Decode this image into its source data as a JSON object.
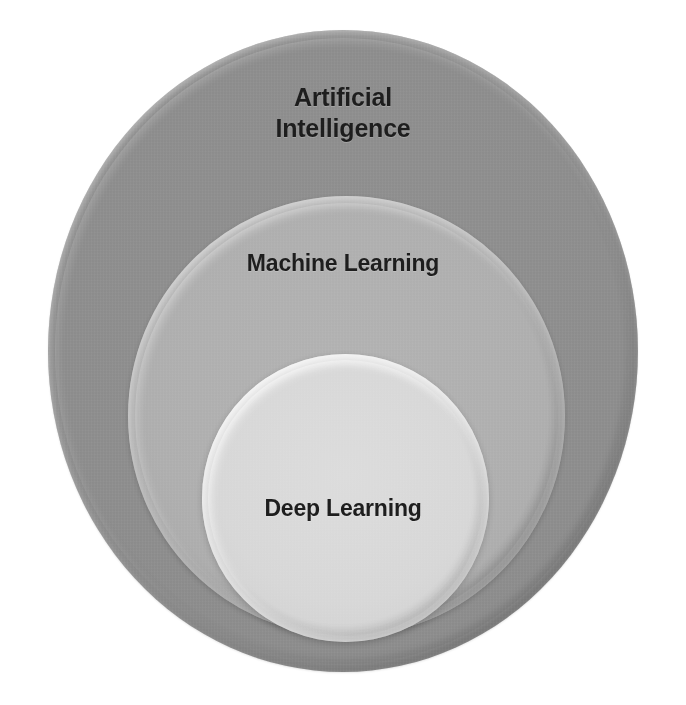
{
  "diagram": {
    "type": "nested-circles",
    "background_color": "#ffffff",
    "layers": [
      {
        "id": "artificial-intelligence",
        "label": "Artificial\nIntelligence",
        "level": 1,
        "fill_color": "#8a8a8a",
        "relation": "outermost superset"
      },
      {
        "id": "machine-learning",
        "label": "Machine Learning",
        "level": 2,
        "fill_color": "#acacac",
        "relation": "subset of Artificial Intelligence"
      },
      {
        "id": "deep-learning",
        "label": "Deep Learning",
        "level": 3,
        "fill_color": "#d4d4d4",
        "relation": "subset of Machine Learning"
      }
    ]
  },
  "chart_data": {
    "type": "pie",
    "title": "",
    "subtitle": "",
    "xlabel": "",
    "ylabel": "",
    "legend_position": "none",
    "grid": false,
    "categories": [
      "Artificial Intelligence",
      "Machine Learning",
      "Deep Learning"
    ],
    "values": [
      319,
      220,
      144
    ],
    "value_units": "circle radius in pixels",
    "annotations": [
      "Artificial Intelligence",
      "Machine Learning",
      "Deep Learning"
    ],
    "series": [
      {
        "name": "nesting level",
        "values": [
          1,
          2,
          3
        ]
      },
      {
        "name": "fill grayscale value",
        "values": [
          138,
          172,
          212
        ]
      }
    ]
  }
}
